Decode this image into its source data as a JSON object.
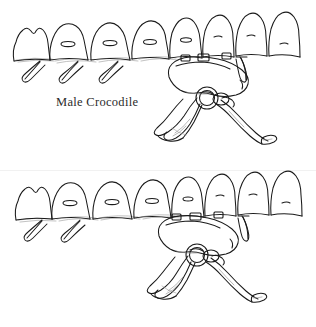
{
  "figure": {
    "name": "crocodile-pelvis-comparison",
    "background_color": "#ffffff",
    "ink_color": "#1a1a1a",
    "shade_color": "#8c8c8c",
    "caption_color": "#2b2b2b",
    "width": 316,
    "height": 327
  },
  "panels": [
    {
      "id": "male",
      "caption": "Male Crocodile",
      "subject": "crocodile-male-pelvis-and-sacral-vertebrae",
      "vertebra_count": 8,
      "rib_process_count": 4,
      "acetabulum": {
        "label": "acetabulum",
        "cx": 207,
        "cy": 98,
        "r": 11
      },
      "features": [
        "sacral-vertebral-column",
        "neural-spines",
        "vertebral-foramina",
        "transverse-rib-processes",
        "ilium",
        "ischium",
        "pubis",
        "acetabulum"
      ]
    },
    {
      "id": "female",
      "caption": "Female Crocodile",
      "subject": "crocodile-female-pelvis-and-sacral-vertebrae",
      "vertebra_count": 8,
      "rib_process_count": 3,
      "acetabulum": {
        "label": "acetabulum",
        "cx": 197,
        "cy": 255,
        "r": 11
      },
      "features": [
        "sacral-vertebral-column",
        "neural-spines",
        "vertebral-foramina",
        "transverse-rib-processes",
        "ilium",
        "ischium",
        "pubis",
        "acetabulum"
      ]
    }
  ]
}
